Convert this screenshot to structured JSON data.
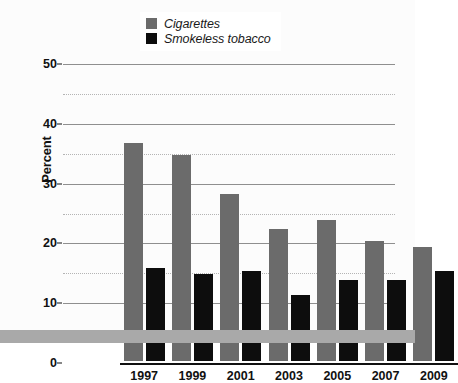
{
  "chart_data": {
    "type": "bar",
    "title": "",
    "xlabel": "",
    "ylabel": "Percent",
    "categories": [
      "1997",
      "1999",
      "2001",
      "2003",
      "2005",
      "2007",
      "2009"
    ],
    "series": [
      {
        "name": "Cigarettes",
        "color": "#6b6b6b",
        "values": [
          36.5,
          34.5,
          28,
          22,
          23.5,
          20,
          19
        ]
      },
      {
        "name": "Smokeless tobacco",
        "color": "#0d0d0d",
        "values": [
          15.5,
          14.5,
          15,
          11,
          13.5,
          13.5,
          15
        ]
      }
    ],
    "ylim": [
      0,
      50
    ],
    "yticks": [
      0,
      10,
      20,
      30,
      40,
      50
    ],
    "yticks_minor": [
      5,
      15,
      25,
      35,
      45
    ],
    "grid": "horizontal-major-solid-minor-dotted",
    "legend_position": "top-center"
  },
  "legend": {
    "items": [
      {
        "label": "Cigarettes",
        "swatch": "gray-swatch"
      },
      {
        "label": "Smokeless tobacco",
        "swatch": "black-swatch"
      }
    ]
  },
  "axes": {
    "y_title": "Percent",
    "y_tick_labels": [
      "50",
      "40",
      "30",
      "20",
      "10",
      "0"
    ],
    "x_tick_labels": [
      "1997",
      "1999",
      "2001",
      "2003",
      "2005",
      "2007",
      "2009"
    ]
  },
  "colors": {
    "cigarettes": "#6b6b6b",
    "smokeless": "#0d0d0d",
    "grid_major": "#8f8f8f",
    "grid_minor": "#b4b4b4",
    "axis": "#111111",
    "background": "#fcfcfc",
    "bottom_band": "#a9a9a9"
  }
}
